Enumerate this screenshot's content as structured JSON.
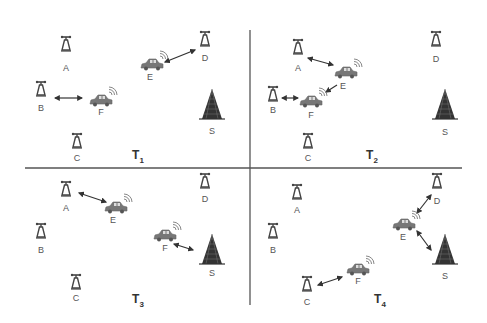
{
  "diagram": {
    "type": "vehicular network snapshots",
    "colors": {
      "background": "#ffffff",
      "divider": "#555555",
      "tower": "#444444",
      "car": "#777777",
      "base_station": "#333333",
      "arrow": "#333333",
      "label": "#555555"
    },
    "dividers": {
      "horizontal": {
        "x1": 25,
        "x2": 462,
        "y": 168
      },
      "vertical": {
        "x": 250,
        "y1": 30,
        "y2": 305
      }
    },
    "panels": [
      {
        "id": "T1",
        "label_main": "T",
        "label_sub": "1",
        "label_pos": [
          138,
          157
        ],
        "nodes": [
          {
            "id": "A",
            "kind": "roadside-unit",
            "pos": [
              66,
              45
            ],
            "label_pos": [
              66,
              68
            ]
          },
          {
            "id": "D",
            "kind": "roadside-unit",
            "pos": [
              205,
              40
            ],
            "label_pos": [
              205,
              58
            ]
          },
          {
            "id": "E",
            "kind": "vehicle",
            "pos": [
              152,
              65
            ],
            "label_pos": [
              150,
              77
            ]
          },
          {
            "id": "B",
            "kind": "roadside-unit",
            "pos": [
              41,
              90
            ],
            "label_pos": [
              41,
              108
            ]
          },
          {
            "id": "F",
            "kind": "vehicle",
            "pos": [
              101,
              101
            ],
            "label_pos": [
              101,
              112
            ]
          },
          {
            "id": "S",
            "kind": "base-station",
            "pos": [
              212,
              105
            ],
            "label_pos": [
              212,
              131
            ]
          },
          {
            "id": "C",
            "kind": "roadside-unit",
            "pos": [
              77,
              142
            ],
            "label_pos": [
              77,
              158
            ]
          }
        ],
        "links": [
          {
            "from": "E",
            "to": "D",
            "type": "bidirectional",
            "x1": 165,
            "y1": 62,
            "x2": 195,
            "y2": 50
          },
          {
            "from": "B",
            "to": "F",
            "type": "bidirectional",
            "x1": 55,
            "y1": 98,
            "x2": 82,
            "y2": 98
          }
        ]
      },
      {
        "id": "T2",
        "label_main": "T",
        "label_sub": "2",
        "label_pos": [
          372,
          157
        ],
        "nodes": [
          {
            "id": "A",
            "kind": "roadside-unit",
            "pos": [
              298,
              48
            ],
            "label_pos": [
              298,
              68
            ]
          },
          {
            "id": "D",
            "kind": "roadside-unit",
            "pos": [
              436,
              40
            ],
            "label_pos": [
              436,
              59
            ]
          },
          {
            "id": "E",
            "kind": "vehicle",
            "pos": [
              346,
              73
            ],
            "label_pos": [
              343,
              86
            ]
          },
          {
            "id": "B",
            "kind": "roadside-unit",
            "pos": [
              273,
              95
            ],
            "label_pos": [
              273,
              110
            ]
          },
          {
            "id": "F",
            "kind": "vehicle",
            "pos": [
              311,
              102
            ],
            "label_pos": [
              311,
              115
            ]
          },
          {
            "id": "S",
            "kind": "base-station",
            "pos": [
              445,
              105
            ],
            "label_pos": [
              445,
              132
            ]
          },
          {
            "id": "C",
            "kind": "roadside-unit",
            "pos": [
              308,
              142
            ],
            "label_pos": [
              308,
              158
            ]
          }
        ],
        "links": [
          {
            "from": "A",
            "to": "E",
            "type": "bidirectional",
            "x1": 308,
            "y1": 58,
            "x2": 333,
            "y2": 65
          },
          {
            "from": "E",
            "to": "F",
            "type": "directed",
            "x1": 337,
            "y1": 85,
            "x2": 326,
            "y2": 92
          },
          {
            "from": "B",
            "to": "F",
            "type": "bidirectional",
            "x1": 282,
            "y1": 98,
            "x2": 298,
            "y2": 98
          }
        ]
      },
      {
        "id": "T3",
        "label_main": "T",
        "label_sub": "3",
        "label_pos": [
          138,
          301
        ],
        "nodes": [
          {
            "id": "A",
            "kind": "roadside-unit",
            "pos": [
              66,
              190
            ],
            "label_pos": [
              66,
              208
            ]
          },
          {
            "id": "D",
            "kind": "roadside-unit",
            "pos": [
              205,
              182
            ],
            "label_pos": [
              205,
              199
            ]
          },
          {
            "id": "E",
            "kind": "vehicle",
            "pos": [
              116,
              208
            ],
            "label_pos": [
              113,
              220
            ]
          },
          {
            "id": "B",
            "kind": "roadside-unit",
            "pos": [
              41,
              232
            ],
            "label_pos": [
              41,
              250
            ]
          },
          {
            "id": "F",
            "kind": "vehicle",
            "pos": [
              165,
              236
            ],
            "label_pos": [
              165,
              248
            ]
          },
          {
            "id": "S",
            "kind": "base-station",
            "pos": [
              212,
              250
            ],
            "label_pos": [
              212,
              273
            ]
          },
          {
            "id": "C",
            "kind": "roadside-unit",
            "pos": [
              76,
              283
            ],
            "label_pos": [
              76,
              298
            ]
          }
        ],
        "links": [
          {
            "from": "A",
            "to": "E",
            "type": "bidirectional",
            "x1": 79,
            "y1": 193,
            "x2": 106,
            "y2": 202
          },
          {
            "from": "F",
            "to": "S",
            "type": "bidirectional",
            "x1": 174,
            "y1": 244,
            "x2": 193,
            "y2": 250
          }
        ]
      },
      {
        "id": "T4",
        "label_main": "T",
        "label_sub": "4",
        "label_pos": [
          380,
          301
        ],
        "nodes": [
          {
            "id": "A",
            "kind": "roadside-unit",
            "pos": [
              297,
              193
            ],
            "label_pos": [
              297,
              210
            ]
          },
          {
            "id": "D",
            "kind": "roadside-unit",
            "pos": [
              437,
              182
            ],
            "label_pos": [
              437,
              201
            ]
          },
          {
            "id": "E",
            "kind": "vehicle",
            "pos": [
              404,
              225
            ],
            "label_pos": [
              403,
              237
            ]
          },
          {
            "id": "B",
            "kind": "roadside-unit",
            "pos": [
              273,
              232
            ],
            "label_pos": [
              273,
              250
            ]
          },
          {
            "id": "F",
            "kind": "vehicle",
            "pos": [
              358,
              270
            ],
            "label_pos": [
              358,
              281
            ]
          },
          {
            "id": "S",
            "kind": "base-station",
            "pos": [
              445,
              250
            ],
            "label_pos": [
              445,
              276
            ]
          },
          {
            "id": "C",
            "kind": "roadside-unit",
            "pos": [
              307,
              285
            ],
            "label_pos": [
              307,
              302
            ]
          }
        ],
        "links": [
          {
            "from": "E",
            "to": "D",
            "type": "bidirectional",
            "x1": 417,
            "y1": 213,
            "x2": 431,
            "y2": 195
          },
          {
            "from": "E",
            "to": "S",
            "type": "bidirectional",
            "x1": 417,
            "y1": 231,
            "x2": 431,
            "y2": 250
          },
          {
            "from": "C",
            "to": "F",
            "type": "bidirectional",
            "x1": 318,
            "y1": 285,
            "x2": 342,
            "y2": 277
          }
        ]
      }
    ]
  }
}
